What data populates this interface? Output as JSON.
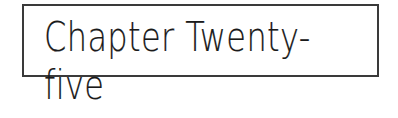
{
  "chapter": {
    "title": "Chapter Twenty-five"
  },
  "colors": {
    "border": "#3a3a3a",
    "text": "#1a1a1a",
    "background": "#ffffff"
  }
}
